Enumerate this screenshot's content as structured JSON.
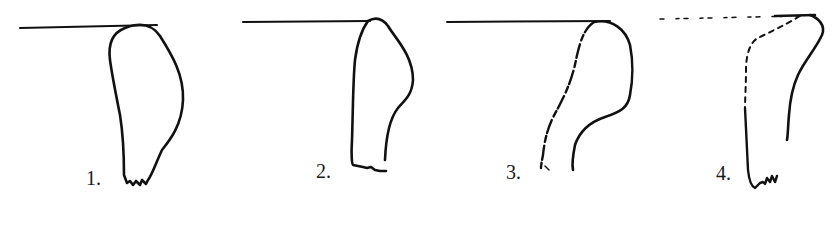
{
  "figure": {
    "panels": [
      {
        "id": 1,
        "label": "1.",
        "style": "solid"
      },
      {
        "id": 2,
        "label": "2.",
        "style": "solid"
      },
      {
        "id": 3,
        "label": "3.",
        "style": "partially-broken"
      },
      {
        "id": 4,
        "label": "4.",
        "style": "dashed-with-solid-segments"
      }
    ],
    "colors": {
      "ink": "#111111",
      "background": "#ffffff"
    }
  }
}
